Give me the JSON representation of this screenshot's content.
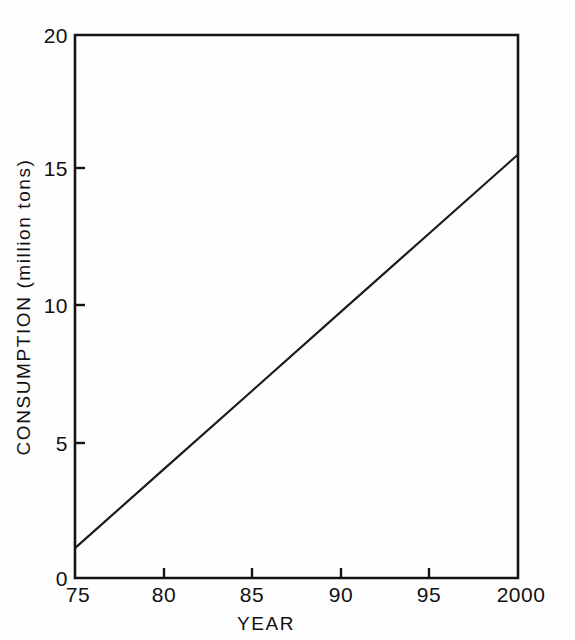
{
  "chart_data": {
    "type": "line",
    "title": "",
    "xlabel": "YEAR",
    "ylabel": "CONSUMPTION (million tons)",
    "xlim": [
      75,
      100
    ],
    "ylim": [
      0,
      20
    ],
    "grid": false,
    "legend": null,
    "x_tick_labels": [
      "75",
      "80",
      "85",
      "90",
      "95",
      "2000"
    ],
    "x_tick_values": [
      75,
      80,
      85,
      90,
      95,
      100
    ],
    "y_tick_labels": [
      "0",
      "5",
      "10",
      "15",
      "20"
    ],
    "y_tick_values": [
      0,
      5,
      10,
      15,
      20
    ],
    "series": [
      {
        "name": "Consumption",
        "x": [
          75,
          80,
          85,
          90,
          95,
          100
        ],
        "values": [
          1.1,
          4.0,
          6.9,
          9.8,
          12.7,
          15.6
        ]
      }
    ],
    "colors": {
      "line": "#1b1b1b",
      "axis": "#141414",
      "background": "#fefefe",
      "text": "#111111"
    }
  },
  "axis_titles": {
    "x": "YEAR",
    "y": "CONSUMPTION (million tons)"
  }
}
